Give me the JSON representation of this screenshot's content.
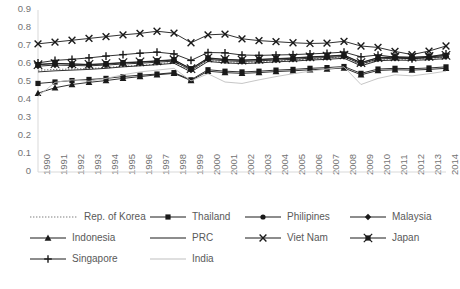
{
  "chart_data": {
    "type": "line",
    "title": "",
    "xlabel": "",
    "ylabel": "",
    "ylim": [
      0,
      0.9
    ],
    "ytick_labels": [
      "0",
      "0.1",
      "0.2",
      "0.3",
      "0.4",
      "0.5",
      "0.6",
      "0.7",
      "0.8",
      "0.9"
    ],
    "ytick_values": [
      0,
      0.1,
      0.2,
      0.3,
      0.4,
      0.5,
      0.6,
      0.7,
      0.8,
      0.9
    ],
    "grid": false,
    "legend_position": "bottom",
    "categories": [
      "1990",
      "1991",
      "1992",
      "1993",
      "1994",
      "1995",
      "1996",
      "1997",
      "1998",
      "1999",
      "2000",
      "2001",
      "2002",
      "2003",
      "2004",
      "2005",
      "2006",
      "2007",
      "2008",
      "2009",
      "2010",
      "2011",
      "2012",
      "2013",
      "2014"
    ],
    "series": [
      {
        "name": "Rep. of Korea",
        "marker": "none",
        "line_style": "dotted",
        "color": "#7f7f7f",
        "values": [
          0.565,
          0.57,
          0.572,
          0.575,
          0.58,
          0.588,
          0.592,
          0.6,
          0.61,
          0.56,
          0.62,
          0.612,
          0.608,
          0.612,
          0.618,
          0.622,
          0.628,
          0.632,
          0.64,
          0.596,
          0.625,
          0.628,
          0.626,
          0.63,
          0.638
        ]
      },
      {
        "name": "Thailand",
        "marker": "square",
        "line_style": "solid",
        "color": "#1a1a1a",
        "values": [
          0.492,
          0.5,
          0.508,
          0.514,
          0.52,
          0.53,
          0.538,
          0.544,
          0.552,
          0.512,
          0.568,
          0.56,
          0.556,
          0.56,
          0.566,
          0.57,
          0.576,
          0.58,
          0.586,
          0.548,
          0.572,
          0.576,
          0.574,
          0.578,
          0.584
        ]
      },
      {
        "name": "Philipines",
        "marker": "circle",
        "line_style": "solid",
        "color": "#1a1a1a",
        "values": [
          0.598,
          0.604,
          0.6,
          0.596,
          0.6,
          0.606,
          0.61,
          0.616,
          0.622,
          0.572,
          0.632,
          0.624,
          0.62,
          0.624,
          0.628,
          0.632,
          0.638,
          0.642,
          0.648,
          0.606,
          0.634,
          0.638,
          0.636,
          0.64,
          0.646
        ]
      },
      {
        "name": "Malaysia",
        "marker": "diamond",
        "line_style": "solid",
        "color": "#1a1a1a",
        "values": [
          0.588,
          0.594,
          0.592,
          0.59,
          0.594,
          0.6,
          0.604,
          0.61,
          0.616,
          0.566,
          0.626,
          0.618,
          0.614,
          0.618,
          0.622,
          0.626,
          0.632,
          0.636,
          0.642,
          0.6,
          0.628,
          0.632,
          0.63,
          0.634,
          0.64
        ]
      },
      {
        "name": "Indonesia",
        "marker": "triangle",
        "line_style": "solid",
        "color": "#1a1a1a",
        "values": [
          0.438,
          0.468,
          0.486,
          0.498,
          0.508,
          0.52,
          0.53,
          0.54,
          0.548,
          0.508,
          0.56,
          0.552,
          0.548,
          0.552,
          0.558,
          0.562,
          0.568,
          0.572,
          0.578,
          0.54,
          0.564,
          0.568,
          0.566,
          0.57,
          0.576
        ]
      },
      {
        "name": "PRC",
        "marker": "none",
        "line_style": "solid",
        "color": "#1a1a1a",
        "values": [
          0.556,
          0.562,
          0.566,
          0.57,
          0.576,
          0.584,
          0.59,
          0.596,
          0.604,
          0.556,
          0.614,
          0.606,
          0.602,
          0.606,
          0.612,
          0.616,
          0.622,
          0.626,
          0.632,
          0.59,
          0.618,
          0.622,
          0.62,
          0.624,
          0.63
        ]
      },
      {
        "name": "Viet Nam",
        "marker": "x",
        "line_style": "solid",
        "color": "#1a1a1a",
        "values": [
          0.712,
          0.722,
          0.732,
          0.742,
          0.752,
          0.762,
          0.77,
          0.782,
          0.772,
          0.718,
          0.762,
          0.766,
          0.74,
          0.73,
          0.724,
          0.718,
          0.714,
          0.716,
          0.726,
          0.7,
          0.692,
          0.67,
          0.652,
          0.672,
          0.7
        ]
      },
      {
        "name": "Japan",
        "marker": "square-x",
        "line_style": "solid",
        "color": "#1a1a1a",
        "values": [
          0.596,
          0.602,
          0.6,
          0.598,
          0.602,
          0.608,
          0.612,
          0.618,
          0.624,
          0.574,
          0.634,
          0.626,
          0.622,
          0.626,
          0.63,
          0.634,
          0.64,
          0.644,
          0.65,
          0.608,
          0.636,
          0.64,
          0.638,
          0.642,
          0.648
        ]
      },
      {
        "name": "Singapore",
        "marker": "plus",
        "line_style": "solid",
        "color": "#1a1a1a",
        "values": [
          0.606,
          0.62,
          0.626,
          0.634,
          0.644,
          0.652,
          0.66,
          0.666,
          0.656,
          0.62,
          0.664,
          0.662,
          0.65,
          0.648,
          0.65,
          0.652,
          0.656,
          0.66,
          0.666,
          0.64,
          0.65,
          0.638,
          0.628,
          0.64,
          0.656
        ]
      },
      {
        "name": "India",
        "marker": "none",
        "line_style": "solid-light",
        "color": "#bfbfbf",
        "values": [
          0.42,
          0.498,
          0.512,
          0.504,
          0.52,
          0.54,
          0.556,
          0.566,
          0.576,
          0.506,
          0.546,
          0.5,
          0.492,
          0.512,
          0.53,
          0.546,
          0.56,
          0.572,
          0.584,
          0.486,
          0.52,
          0.54,
          0.534,
          0.546,
          0.56
        ]
      }
    ]
  },
  "plot_area": {
    "left": 38,
    "top": 10,
    "right": 446,
    "bottom": 172
  },
  "legend": {
    "rows": [
      [
        {
          "label": "Rep. of Korea",
          "marker": "none",
          "line_style": "dotted",
          "x": 0,
          "key_width": 52
        },
        {
          "label": "Thailand",
          "marker": "square",
          "line_style": "solid",
          "x": 120,
          "key_width": 40
        },
        {
          "label": "Philipines",
          "marker": "circle",
          "line_style": "solid",
          "x": 215,
          "key_width": 40
        },
        {
          "label": "Malaysia",
          "marker": "diamond",
          "line_style": "solid",
          "x": 320,
          "key_width": 40
        }
      ],
      [
        {
          "label": "Indonesia",
          "marker": "triangle",
          "line_style": "solid",
          "x": 0,
          "key_width": 40
        },
        {
          "label": "PRC",
          "marker": "none",
          "line_style": "solid",
          "x": 120,
          "key_width": 40
        },
        {
          "label": "Viet Nam",
          "marker": "x",
          "line_style": "solid",
          "x": 215,
          "key_width": 40
        },
        {
          "label": "Japan",
          "marker": "square-x",
          "line_style": "solid",
          "x": 320,
          "key_width": 40
        }
      ],
      [
        {
          "label": "Singapore",
          "marker": "plus",
          "line_style": "solid",
          "x": 0,
          "key_width": 40
        },
        {
          "label": "India",
          "marker": "none",
          "line_style": "solid-light",
          "x": 120,
          "key_width": 40
        }
      ]
    ]
  }
}
